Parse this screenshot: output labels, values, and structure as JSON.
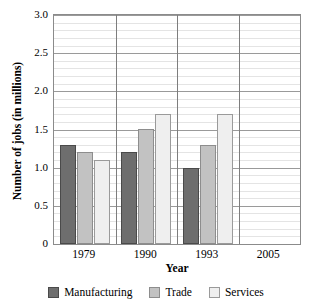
{
  "chart_data": {
    "type": "bar",
    "title": "",
    "xlabel": "Year",
    "ylabel": "Number of jobs (in millions)",
    "categories": [
      "1979",
      "1990",
      "1993",
      "2005"
    ],
    "series": [
      {
        "name": "Manufacturing",
        "color": "#6e6e6e",
        "values": [
          1.3,
          1.2,
          1.0,
          null
        ]
      },
      {
        "name": "Trade",
        "color": "#c2c2c2",
        "values": [
          1.2,
          1.5,
          1.3,
          null
        ]
      },
      {
        "name": "Services",
        "color": "#efefef",
        "values": [
          1.1,
          1.7,
          1.7,
          null
        ]
      }
    ],
    "ylim": [
      0,
      3.0
    ],
    "y_ticks": [
      "0",
      "0.5",
      "1.0",
      "1.5",
      "2.0",
      "2.5",
      "3.0"
    ],
    "y_tick_values": [
      0,
      0.5,
      1.0,
      1.5,
      2.0,
      2.5,
      3.0
    ],
    "minor_tick_step": 0.1,
    "grid": true,
    "legend_position": "bottom"
  },
  "legend": {
    "items": [
      {
        "label": "Manufacturing"
      },
      {
        "label": "Trade"
      },
      {
        "label": "Services"
      }
    ]
  }
}
